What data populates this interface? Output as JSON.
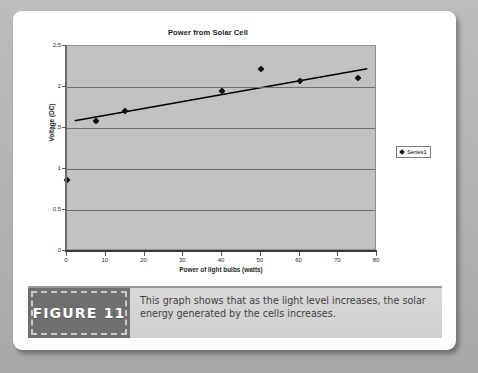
{
  "figure": {
    "badge_label": "FIGURE 11",
    "caption_text": "This graph shows that as the light level increases, the solar energy generated by the cells increases."
  },
  "chart_data": {
    "type": "scatter",
    "title": "Power from Solar Cell",
    "xlabel": "Power of light bulbs (watts)",
    "ylabel": "Voltage (DC)",
    "xlim": [
      0,
      80
    ],
    "ylim": [
      0,
      2.5
    ],
    "xticks": [
      0,
      10,
      20,
      30,
      40,
      50,
      60,
      70,
      80
    ],
    "xticklabels": [
      "0",
      "10",
      "20",
      "30",
      "40",
      "50",
      "60",
      "70",
      "80"
    ],
    "yticks": [
      0,
      0.5,
      1,
      1.5,
      2,
      2.5
    ],
    "yticklabels": [
      "0",
      "0.5",
      "1",
      "1.5",
      "2",
      "2.5"
    ],
    "grid": "horizontal",
    "legend_position": "right",
    "series": [
      {
        "name": "Series1",
        "marker": "diamond",
        "color": "#111111",
        "x": [
          0,
          7.5,
          15,
          40,
          50,
          60,
          75
        ],
        "y": [
          0.87,
          1.58,
          1.71,
          1.95,
          2.22,
          2.07,
          2.11
        ]
      }
    ],
    "trendline": {
      "name": "Linear trendline",
      "color": "#000000",
      "x": [
        2,
        78
      ],
      "y": [
        1.58,
        2.22
      ]
    }
  }
}
